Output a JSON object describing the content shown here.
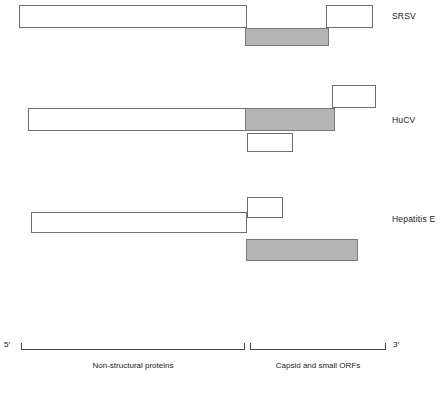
{
  "figure": {
    "width": 448,
    "height": 393,
    "shaded_color": "#b5b5b5",
    "outline_color": "#6e6e6e",
    "background": "#ffffff"
  },
  "rows": [
    {
      "id": "srsv",
      "label": "SRSV",
      "label_x": 392,
      "label_y": 12,
      "boxes": [
        {
          "name": "orf1-box",
          "x": 19,
          "y": 5,
          "w": 228,
          "h": 23,
          "shaded": false
        },
        {
          "name": "orf2-box",
          "x": 245,
          "y": 28,
          "w": 84,
          "h": 18,
          "shaded": true
        },
        {
          "name": "orf3-box",
          "x": 326,
          "y": 5,
          "w": 47,
          "h": 23,
          "shaded": false
        }
      ]
    },
    {
      "id": "hucv",
      "label": "HuCV",
      "label_x": 392,
      "label_y": 116,
      "boxes": [
        {
          "name": "orf3-box",
          "x": 332,
          "y": 85,
          "w": 44,
          "h": 23,
          "shaded": false
        },
        {
          "name": "orf1-box",
          "x": 28,
          "y": 108,
          "w": 218,
          "h": 23,
          "shaded": false
        },
        {
          "name": "orf2-box",
          "x": 245,
          "y": 108,
          "w": 90,
          "h": 23,
          "shaded": true
        },
        {
          "name": "orf4-box",
          "x": 247,
          "y": 133,
          "w": 46,
          "h": 19,
          "shaded": false
        }
      ]
    },
    {
      "id": "hepatitis-e",
      "label": "Hepatitis E",
      "label_x": 392,
      "label_y": 215,
      "boxes": [
        {
          "name": "orf3-box",
          "x": 247,
          "y": 197,
          "w": 36,
          "h": 21,
          "shaded": false
        },
        {
          "name": "orf1-box",
          "x": 31,
          "y": 212,
          "w": 216,
          "h": 21,
          "shaded": false
        },
        {
          "name": "orf2-box",
          "x": 246,
          "y": 239,
          "w": 112,
          "h": 22,
          "shaded": true
        }
      ]
    }
  ],
  "axis": {
    "y": 343,
    "five_prime": {
      "label": "5′",
      "x": 4,
      "y": 341
    },
    "three_prime": {
      "label": "3′",
      "x": 393,
      "y": 341
    },
    "segments": [
      {
        "name": "non-structural-segment",
        "caption": "Non-structural proteins",
        "x": 21,
        "w": 224,
        "caption_x": 21,
        "caption_w": 224,
        "caption_y": 362
      },
      {
        "name": "capsid-segment",
        "caption": "Capsid and small ORFs",
        "x": 250,
        "w": 136,
        "caption_x": 250,
        "caption_w": 136,
        "caption_y": 362
      }
    ]
  }
}
